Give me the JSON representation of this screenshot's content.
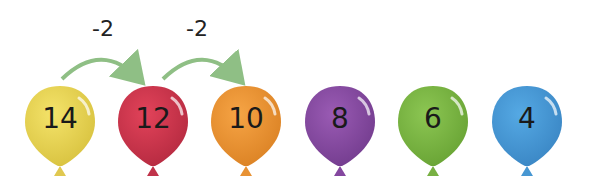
{
  "diagram": {
    "steps": [
      {
        "label": "-2",
        "from": 14,
        "to": 12
      },
      {
        "label": "-2",
        "from": 12,
        "to": 10
      }
    ],
    "balloons": [
      {
        "value": "14",
        "color": "#f4e36a",
        "shade": "#d8c23f",
        "knot": "#e0c850"
      },
      {
        "value": "12",
        "color": "#e2435a",
        "shade": "#b52a40",
        "knot": "#c0334a"
      },
      {
        "value": "10",
        "color": "#f6a445",
        "shade": "#db8224",
        "knot": "#e89234"
      },
      {
        "value": "8",
        "color": "#9a5bb4",
        "shade": "#733c8e",
        "knot": "#84479f"
      },
      {
        "value": "6",
        "color": "#8cc653",
        "shade": "#68a334",
        "knot": "#78b043"
      },
      {
        "value": "4",
        "color": "#55a9e4",
        "shade": "#3a86c4",
        "knot": "#4797d2"
      }
    ],
    "arrow_color": "#8fbf85"
  }
}
